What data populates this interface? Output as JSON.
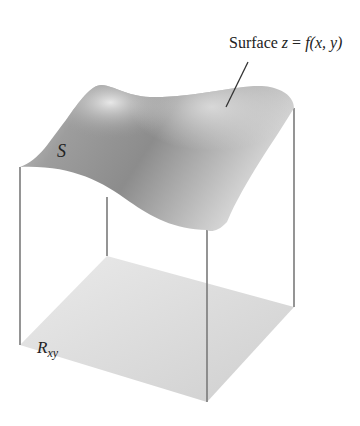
{
  "figure": {
    "surface_label": {
      "prefix": "Surface ",
      "z": "z",
      "eq": " = ",
      "f": "f",
      "args": "(x, y)"
    },
    "surface_symbol": "S",
    "region_symbol": "R",
    "region_subscript": "xy"
  },
  "colors": {
    "surface_dark": "#8f8f8f",
    "surface_light": "#e4e4e4",
    "region": "#dedede",
    "edge": "#7a7a7a"
  }
}
